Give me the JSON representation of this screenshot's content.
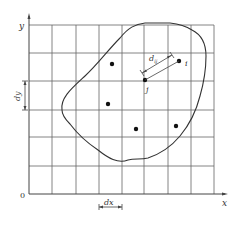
{
  "axes": {
    "x_label": "x",
    "y_label": "y",
    "origin_label": "0"
  },
  "grid": {
    "columns": 8,
    "rows": 6
  },
  "dimensions": {
    "dx_label": "dx",
    "dy_label": "dy",
    "distance_label": "d",
    "distance_subscript": "ij"
  },
  "points": {
    "i_label": "i",
    "j_label": "j",
    "count": 6
  },
  "colors": {
    "line": "#555555",
    "curve": "#333333",
    "dot": "#111111"
  }
}
